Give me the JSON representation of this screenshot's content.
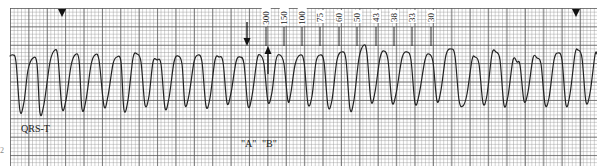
{
  "strip": {
    "label_qrs_t": "QRS-T",
    "label_a": "\"A\"",
    "label_b": "\"B\"",
    "edge_mark": "2"
  },
  "markers": {
    "triangles_x": [
      62,
      576
    ],
    "arrow_down": {
      "x": 247,
      "y1": 22,
      "y2": 46
    },
    "arrow_up": {
      "x": 268,
      "y1": 74,
      "y2": 46
    }
  },
  "rate_scale": {
    "ticks": [
      {
        "label": "300",
        "x": 266
      },
      {
        "label": "150",
        "x": 284
      },
      {
        "label": "100",
        "x": 302
      },
      {
        "label": "75",
        "x": 320
      },
      {
        "label": "60",
        "x": 339
      },
      {
        "label": "50",
        "x": 357
      },
      {
        "label": "43",
        "x": 376
      },
      {
        "label": "38",
        "x": 394
      },
      {
        "label": "33",
        "x": 412
      },
      {
        "label": "30",
        "x": 431
      }
    ]
  },
  "waveform": {
    "stroke": "#222222",
    "points": [
      [
        10,
        56
      ],
      [
        13,
        55
      ],
      [
        16,
        62
      ],
      [
        20,
        111
      ],
      [
        24,
        102
      ],
      [
        28,
        70
      ],
      [
        33,
        58
      ],
      [
        37,
        64
      ],
      [
        40,
        113
      ],
      [
        44,
        104
      ],
      [
        50,
        62
      ],
      [
        55,
        50
      ],
      [
        58,
        58
      ],
      [
        62,
        108
      ],
      [
        66,
        100
      ],
      [
        71,
        66
      ],
      [
        75,
        55
      ],
      [
        79,
        60
      ],
      [
        82,
        109
      ],
      [
        86,
        100
      ],
      [
        91,
        65
      ],
      [
        95,
        55
      ],
      [
        99,
        60
      ],
      [
        104,
        106
      ],
      [
        108,
        96
      ],
      [
        113,
        64
      ],
      [
        117,
        57
      ],
      [
        121,
        62
      ],
      [
        124,
        110
      ],
      [
        128,
        100
      ],
      [
        133,
        58
      ],
      [
        137,
        54
      ],
      [
        141,
        62
      ],
      [
        145,
        105
      ],
      [
        149,
        96
      ],
      [
        153,
        62
      ],
      [
        157,
        60
      ],
      [
        161,
        64
      ],
      [
        165,
        108
      ],
      [
        169,
        98
      ],
      [
        174,
        62
      ],
      [
        178,
        56
      ],
      [
        182,
        64
      ],
      [
        185,
        105
      ],
      [
        189,
        95
      ],
      [
        194,
        62
      ],
      [
        198,
        55
      ],
      [
        202,
        62
      ],
      [
        206,
        106
      ],
      [
        210,
        98
      ],
      [
        215,
        60
      ],
      [
        219,
        57
      ],
      [
        223,
        62
      ],
      [
        227,
        103
      ],
      [
        231,
        93
      ],
      [
        236,
        62
      ],
      [
        240,
        57
      ],
      [
        244,
        64
      ],
      [
        248,
        106
      ],
      [
        252,
        96
      ],
      [
        257,
        60
      ],
      [
        260,
        55
      ],
      [
        264,
        64
      ],
      [
        268,
        102
      ],
      [
        272,
        92
      ],
      [
        276,
        60
      ],
      [
        280,
        55
      ],
      [
        284,
        64
      ],
      [
        288,
        101
      ],
      [
        291,
        92
      ],
      [
        295,
        65
      ],
      [
        300,
        55
      ],
      [
        304,
        62
      ],
      [
        308,
        104
      ],
      [
        312,
        96
      ],
      [
        316,
        62
      ],
      [
        320,
        55
      ],
      [
        324,
        62
      ],
      [
        328,
        106
      ],
      [
        332,
        100
      ],
      [
        337,
        60
      ],
      [
        342,
        52
      ],
      [
        346,
        60
      ],
      [
        350,
        109
      ],
      [
        354,
        100
      ],
      [
        359,
        58
      ],
      [
        364,
        45
      ],
      [
        367,
        54
      ],
      [
        371,
        101
      ],
      [
        375,
        92
      ],
      [
        380,
        58
      ],
      [
        384,
        51
      ],
      [
        388,
        60
      ],
      [
        392,
        102
      ],
      [
        396,
        94
      ],
      [
        402,
        58
      ],
      [
        407,
        52
      ],
      [
        411,
        60
      ],
      [
        415,
        103
      ],
      [
        419,
        95
      ],
      [
        425,
        60
      ],
      [
        429,
        54
      ],
      [
        433,
        62
      ],
      [
        437,
        101
      ],
      [
        441,
        90
      ],
      [
        446,
        55
      ],
      [
        451,
        49
      ],
      [
        455,
        56
      ],
      [
        459,
        100
      ],
      [
        463,
        106
      ],
      [
        467,
        94
      ],
      [
        472,
        60
      ],
      [
        475,
        57
      ],
      [
        479,
        64
      ],
      [
        483,
        103
      ],
      [
        487,
        95
      ],
      [
        492,
        54
      ],
      [
        496,
        52
      ],
      [
        500,
        60
      ],
      [
        504,
        105
      ],
      [
        508,
        96
      ],
      [
        513,
        60
      ],
      [
        517,
        62
      ],
      [
        520,
        65
      ],
      [
        524,
        101
      ],
      [
        528,
        92
      ],
      [
        533,
        58
      ],
      [
        537,
        58
      ],
      [
        541,
        64
      ],
      [
        545,
        104
      ],
      [
        549,
        98
      ],
      [
        554,
        60
      ],
      [
        558,
        53
      ],
      [
        562,
        60
      ],
      [
        566,
        105
      ],
      [
        570,
        94
      ],
      [
        575,
        54
      ],
      [
        578,
        50
      ],
      [
        582,
        58
      ],
      [
        586,
        102
      ],
      [
        590,
        93
      ],
      [
        595,
        55
      ],
      [
        597,
        54
      ]
    ]
  }
}
